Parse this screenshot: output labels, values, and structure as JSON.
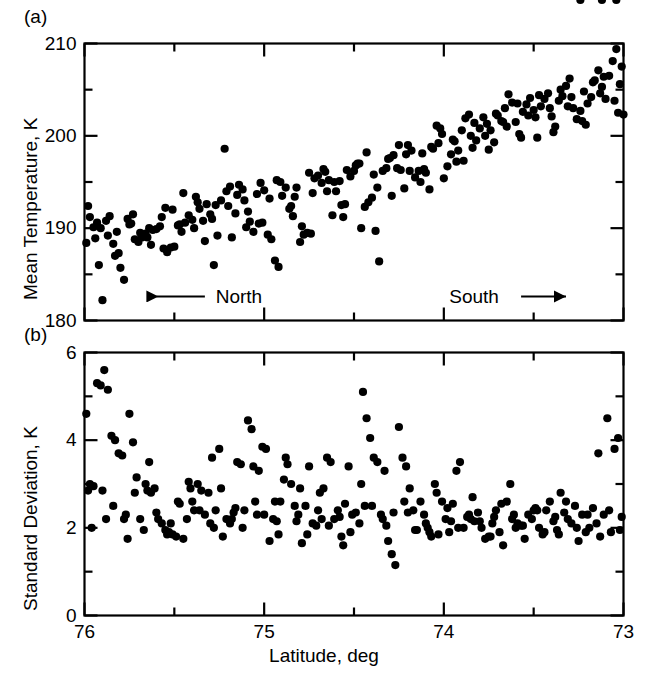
{
  "figure": {
    "background": "#ffffff",
    "marker_color": "#000000",
    "axis_color": "#000000"
  },
  "panels": {
    "a": {
      "tag": "(a)"
    },
    "b": {
      "tag": "(b)"
    }
  },
  "annotations": {
    "north": "North",
    "south": "South"
  },
  "chart_data": [
    {
      "type": "scatter",
      "panel": "(a)",
      "title": "",
      "xlabel": "Latitude, deg",
      "ylabel": "Mean Temperature, K",
      "xlim": [
        76,
        73
      ],
      "ylim": [
        180,
        210
      ],
      "x_major_ticks": [
        76,
        75,
        74,
        73
      ],
      "x_minor_ticks": [
        75.5,
        74.5,
        73.5
      ],
      "x_tick_labels": [
        "76",
        "75",
        "74",
        "73"
      ],
      "y_major_ticks": [
        180,
        190,
        200,
        210
      ],
      "y_minor_ticks": [
        185,
        195,
        205
      ],
      "y_tick_labels": [
        "180",
        "190",
        "200",
        "210"
      ],
      "grid": false,
      "legend": "none",
      "annotations": [
        {
          "text": "North",
          "arrow": "left",
          "x": 75.45,
          "y": 182.6
        },
        {
          "text": "South",
          "arrow": "right",
          "x": 73.75,
          "y": 182.6
        }
      ],
      "x": [
        75.98,
        75.97,
        75.95,
        75.94,
        75.92,
        75.9,
        75.88,
        75.86,
        75.84,
        75.82,
        75.8,
        75.78,
        75.76,
        75.74,
        75.72,
        75.7,
        75.68,
        75.66,
        75.64,
        75.62,
        75.6,
        75.58,
        75.56,
        75.54,
        75.52,
        75.5,
        75.48,
        75.46,
        75.44,
        75.42,
        75.4,
        75.38,
        75.36,
        75.34,
        75.32,
        75.3,
        75.28,
        75.26,
        75.24,
        75.22,
        75.2,
        75.18,
        75.16,
        75.14,
        75.12,
        75.1,
        75.08,
        75.06,
        75.04,
        75.02,
        75.0,
        74.98,
        74.96,
        74.94,
        74.92,
        74.9,
        74.88,
        74.86,
        74.84,
        74.82,
        74.8,
        74.78,
        74.76,
        74.74,
        74.72,
        74.7,
        74.68,
        74.66,
        74.64,
        74.62,
        74.6,
        74.58,
        74.56,
        74.54,
        74.52,
        74.5,
        74.48,
        74.46,
        74.44,
        74.42,
        74.4,
        74.38,
        74.36,
        74.34,
        74.32,
        74.3,
        74.28,
        74.26,
        74.24,
        74.22,
        74.2,
        74.18,
        74.16,
        74.14,
        74.12,
        74.1,
        74.08,
        74.06,
        74.04,
        74.02,
        74.0,
        73.98,
        73.96,
        73.94,
        73.92,
        73.9,
        73.88,
        73.86,
        73.84,
        73.82,
        73.8,
        73.78,
        73.76,
        73.74,
        73.72,
        73.7,
        73.68,
        73.66,
        73.64,
        73.62,
        73.6,
        73.58,
        73.56,
        73.54,
        73.52,
        73.5,
        73.48,
        73.46,
        73.44,
        73.42,
        73.4,
        73.38,
        73.36,
        73.34,
        73.32,
        73.3,
        73.28,
        73.26,
        73.24,
        73.22,
        73.2,
        73.18,
        73.16,
        73.14,
        73.12,
        73.1,
        73.08,
        73.06,
        73.04,
        73.02,
        73.0,
        75.93,
        75.87,
        75.81,
        75.75,
        75.69,
        75.63,
        75.57,
        75.51,
        75.45,
        75.39,
        75.33,
        75.27,
        75.21,
        75.15,
        75.09,
        75.03,
        74.97,
        74.91,
        74.85,
        74.79,
        74.73,
        74.67,
        74.61,
        74.55,
        74.49,
        74.43,
        74.37,
        74.31,
        74.25,
        74.19,
        74.13,
        74.07,
        74.01,
        73.95,
        73.89,
        73.83,
        73.77,
        73.71,
        73.65,
        73.59,
        73.53,
        73.47,
        73.41,
        73.35,
        73.29,
        73.23,
        73.17,
        73.11,
        73.05,
        73.01,
        75.99,
        75.91,
        75.83,
        75.73,
        75.65,
        75.55,
        75.47,
        75.37,
        75.29,
        75.19,
        75.11,
        75.01,
        74.93,
        74.83,
        74.75,
        74.65,
        74.57,
        74.47,
        74.39,
        74.29,
        74.21,
        74.11,
        74.03,
        73.93,
        73.85,
        73.75,
        73.67,
        73.57,
        73.49,
        73.39,
        73.31,
        73.21,
        73.13,
        73.03
      ],
      "y": [
        192.4,
        191.2,
        190.1,
        188.9,
        186.0,
        182.2,
        190.8,
        191.3,
        188.3,
        189.6,
        185.7,
        184.4,
        191.0,
        190.5,
        188.8,
        188.5,
        189.0,
        189.4,
        190.0,
        189.8,
        189.9,
        190.2,
        187.8,
        187.4,
        187.9,
        188.0,
        190.3,
        189.6,
        190.6,
        191.4,
        190.9,
        193.4,
        192.1,
        190.8,
        192.6,
        191.5,
        186.0,
        189.2,
        193.0,
        198.6,
        192.4,
        189.0,
        191.6,
        194.7,
        194.2,
        190.1,
        190.7,
        189.6,
        193.7,
        194.9,
        194.1,
        189.3,
        188.8,
        186.5,
        185.8,
        193.5,
        194.4,
        192.1,
        191.3,
        194.4,
        188.5,
        189.3,
        189.5,
        189.4,
        195.4,
        195.7,
        194.9,
        196.1,
        195.2,
        191.4,
        194.0,
        195.1,
        191.2,
        196.3,
        195.6,
        196.2,
        197.0,
        190.0,
        192.3,
        192.8,
        193.3,
        189.7,
        186.4,
        196.2,
        196.5,
        197.6,
        197.9,
        196.5,
        196.3,
        194.3,
        199.0,
        198.4,
        195.5,
        196.2,
        198.1,
        196.0,
        194.2,
        198.6,
        201.1,
        200.8,
        195.4,
        196.7,
        198.0,
        199.4,
        198.4,
        200.6,
        201.9,
        202.3,
        198.7,
        199.5,
        200.8,
        202.0,
        201.3,
        200.6,
        199.3,
        202.2,
        201.6,
        203.0,
        204.5,
        203.6,
        201.5,
        200.2,
        202.6,
        203.4,
        204.1,
        202.8,
        199.8,
        203.2,
        204.0,
        204.6,
        202.1,
        201.0,
        203.8,
        204.3,
        205.4,
        206.2,
        203.0,
        201.8,
        202.7,
        204.8,
        203.5,
        204.2,
        206.0,
        207.1,
        205.3,
        204.0,
        206.5,
        208.1,
        209.4,
        205.6,
        202.3,
        190.6,
        189.2,
        187.3,
        190.4,
        189.5,
        188.2,
        191.2,
        192.0,
        193.8,
        190.0,
        188.6,
        192.5,
        194.0,
        193.6,
        191.8,
        190.5,
        193.2,
        195.0,
        192.4,
        190.2,
        193.8,
        196.4,
        195.0,
        192.6,
        196.8,
        198.2,
        194.4,
        197.5,
        199.0,
        196.2,
        195.0,
        198.8,
        200.2,
        199.6,
        197.3,
        201.4,
        200.0,
        202.4,
        201.0,
        203.5,
        202.2,
        204.4,
        203.0,
        205.0,
        204.2,
        201.6,
        205.8,
        206.4,
        203.8,
        207.5,
        188.4,
        190.0,
        187.0,
        191.5,
        189.0,
        192.2,
        190.4,
        192.8,
        191.0,
        194.5,
        193.0,
        190.6,
        195.2,
        193.4,
        196.0,
        194.0,
        192.5,
        197.0,
        195.8,
        193.5,
        198.0,
        196.4,
        199.2,
        197.2,
        200.0,
        198.5,
        201.5,
        199.8,
        202.0,
        200.4,
        203.2,
        201.2,
        204.6,
        202.5
      ]
    },
    {
      "type": "scatter",
      "panel": "(b)",
      "title": "",
      "xlabel": "Latitude, deg",
      "ylabel": "Standard Deviation, K",
      "xlim": [
        76,
        73
      ],
      "ylim": [
        0,
        6
      ],
      "x_major_ticks": [
        76,
        75,
        74,
        73
      ],
      "x_minor_ticks": [
        75.5,
        74.5,
        73.5
      ],
      "x_tick_labels": [
        "76",
        "75",
        "74",
        "73"
      ],
      "y_major_ticks": [
        0,
        2,
        4,
        6
      ],
      "y_minor_ticks": [
        1,
        3,
        5
      ],
      "y_tick_labels": [
        "0",
        "2",
        "4",
        "6"
      ],
      "grid": false,
      "legend": "none",
      "x": [
        75.99,
        75.97,
        75.95,
        75.93,
        75.91,
        75.89,
        75.87,
        75.85,
        75.83,
        75.81,
        75.79,
        75.77,
        75.75,
        75.73,
        75.71,
        75.69,
        75.67,
        75.65,
        75.63,
        75.61,
        75.59,
        75.57,
        75.55,
        75.53,
        75.51,
        75.49,
        75.47,
        75.45,
        75.43,
        75.41,
        75.39,
        75.37,
        75.35,
        75.33,
        75.31,
        75.29,
        75.27,
        75.25,
        75.23,
        75.21,
        75.19,
        75.17,
        75.15,
        75.13,
        75.11,
        75.09,
        75.07,
        75.05,
        75.03,
        75.01,
        74.99,
        74.97,
        74.95,
        74.93,
        74.91,
        74.89,
        74.87,
        74.85,
        74.83,
        74.81,
        74.79,
        74.77,
        74.75,
        74.73,
        74.71,
        74.69,
        74.67,
        74.65,
        74.63,
        74.61,
        74.59,
        74.57,
        74.55,
        74.53,
        74.51,
        74.49,
        74.47,
        74.45,
        74.43,
        74.41,
        74.39,
        74.37,
        74.35,
        74.33,
        74.31,
        74.29,
        74.27,
        74.25,
        74.23,
        74.21,
        74.19,
        74.17,
        74.15,
        74.13,
        74.11,
        74.09,
        74.07,
        74.05,
        74.03,
        74.01,
        73.99,
        73.97,
        73.95,
        73.93,
        73.91,
        73.89,
        73.87,
        73.85,
        73.83,
        73.81,
        73.79,
        73.77,
        73.75,
        73.73,
        73.71,
        73.69,
        73.67,
        73.65,
        73.63,
        73.61,
        73.59,
        73.57,
        73.55,
        73.53,
        73.51,
        73.49,
        73.47,
        73.45,
        73.43,
        73.41,
        73.39,
        73.37,
        73.35,
        73.33,
        73.31,
        73.29,
        73.27,
        73.25,
        73.23,
        73.21,
        73.19,
        73.17,
        73.15,
        73.13,
        73.11,
        73.09,
        73.07,
        73.05,
        73.03,
        73.01,
        75.96,
        75.9,
        75.84,
        75.78,
        75.72,
        75.66,
        75.6,
        75.54,
        75.48,
        75.42,
        75.36,
        75.3,
        75.24,
        75.18,
        75.12,
        75.06,
        75.0,
        74.94,
        74.88,
        74.82,
        74.76,
        74.7,
        74.64,
        74.58,
        74.52,
        74.46,
        74.4,
        74.34,
        74.28,
        74.22,
        74.16,
        74.1,
        74.04,
        73.98,
        73.92,
        73.86,
        73.8,
        73.74,
        73.68,
        73.62,
        73.56,
        73.5,
        73.44,
        73.38,
        73.32,
        73.26,
        73.2,
        73.14,
        73.08,
        73.02,
        75.98,
        75.88,
        75.76,
        75.64,
        75.52,
        75.4,
        75.28,
        75.16,
        75.04,
        74.92,
        74.8,
        74.68,
        74.56,
        74.44,
        74.32,
        74.2,
        74.08,
        73.96,
        73.84,
        73.72,
        73.6,
        73.48,
        73.36,
        73.24,
        73.12,
        73.04
      ],
      "y": [
        4.6,
        3.0,
        2.95,
        5.3,
        5.25,
        5.6,
        5.15,
        4.1,
        4.0,
        3.7,
        3.65,
        2.3,
        4.6,
        3.95,
        3.15,
        2.2,
        1.95,
        2.85,
        2.8,
        2.9,
        2.2,
        2.1,
        1.95,
        1.9,
        1.85,
        1.8,
        2.55,
        1.75,
        2.2,
        2.9,
        2.4,
        3.0,
        2.85,
        2.3,
        2.8,
        3.6,
        2.4,
        3.8,
        1.8,
        2.2,
        2.1,
        2.35,
        3.5,
        3.45,
        2.4,
        4.45,
        4.25,
        2.6,
        3.3,
        3.85,
        3.8,
        1.7,
        2.2,
        2.15,
        2.6,
        3.1,
        3.45,
        3.0,
        2.5,
        2.3,
        1.65,
        2.5,
        3.4,
        2.1,
        2.05,
        2.8,
        2.9,
        3.6,
        3.5,
        2.2,
        2.4,
        1.8,
        2.55,
        3.4,
        2.3,
        2.35,
        2.1,
        5.1,
        4.5,
        4.05,
        3.6,
        3.5,
        2.3,
        3.3,
        1.7,
        1.4,
        1.15,
        4.3,
        3.6,
        3.4,
        2.9,
        2.4,
        1.95,
        2.6,
        2.3,
        2.0,
        1.8,
        3.0,
        1.85,
        2.6,
        2.2,
        1.9,
        2.55,
        3.3,
        3.5,
        2.0,
        2.25,
        2.2,
        2.15,
        2.35,
        2.0,
        1.75,
        1.8,
        2.1,
        2.4,
        1.9,
        1.6,
        2.6,
        3.0,
        2.3,
        2.1,
        2.05,
        1.75,
        2.3,
        2.2,
        2.45,
        2.0,
        1.85,
        2.4,
        2.6,
        2.15,
        1.95,
        2.8,
        2.35,
        2.2,
        2.1,
        2.5,
        1.7,
        2.3,
        1.9,
        2.0,
        2.45,
        2.1,
        1.8,
        2.3,
        4.5,
        1.9,
        3.8,
        4.05,
        2.25,
        2.0,
        2.85,
        2.5,
        2.2,
        2.8,
        3.0,
        2.35,
        1.85,
        2.6,
        3.05,
        2.4,
        2.1,
        2.9,
        2.2,
        2.0,
        3.4,
        2.3,
        2.6,
        3.6,
        2.15,
        1.85,
        2.4,
        2.05,
        2.25,
        1.9,
        3.0,
        2.5,
        2.2,
        2.35,
        2.6,
        1.95,
        2.1,
        2.8,
        2.45,
        2.0,
        2.3,
        2.15,
        1.8,
        2.55,
        2.2,
        2.05,
        2.4,
        1.9,
        2.25,
        2.6,
        2.0,
        2.3,
        3.7,
        2.4,
        1.95,
        2.85,
        2.2,
        1.75,
        3.5,
        2.1,
        2.6,
        2.0,
        2.45,
        2.3,
        1.85,
        2.9,
        2.2,
        1.6,
        2.5,
        2.05,
        2.35,
        1.9,
        2.15,
        2.7,
        2.25,
        2.0,
        2.4,
        1.85
      ]
    }
  ]
}
